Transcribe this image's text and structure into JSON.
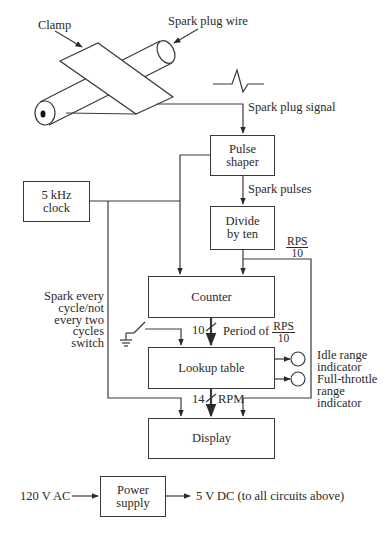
{
  "diagram": {
    "type": "block-diagram",
    "title_area": {
      "clamp_label": "Clamp",
      "wire_label": "Spark plug wire",
      "signal_label": "Spark plug signal"
    },
    "blocks": {
      "pulse_shaper": {
        "line1": "Pulse",
        "line2": "shaper"
      },
      "clock": {
        "line1": "5 kHz",
        "line2": "clock"
      },
      "divide": {
        "line1": "Divide",
        "line2": "by ten"
      },
      "counter": {
        "label": "Counter"
      },
      "lookup": {
        "label": "Lookup table"
      },
      "display": {
        "label": "Display"
      },
      "power": {
        "line1": "Power",
        "line2": "supply"
      }
    },
    "signals": {
      "spark_pulses": "Spark pulses",
      "rps_num": "RPS",
      "rps_den": "10",
      "bus_counter_width": "10",
      "period_of": "Period of",
      "period_num": "RPS",
      "period_den": "10",
      "bus_display_width": "14",
      "rpm": "RPM"
    },
    "switch_label": [
      "Spark every",
      "cycle/not",
      "every two",
      "cycles",
      "switch"
    ],
    "indicators": {
      "idle": [
        "Idle range",
        "indicator"
      ],
      "full": [
        "Full-throttle",
        "range",
        "indicator"
      ]
    },
    "power": {
      "input": "120 V AC",
      "output": "5 V DC (to all circuits above)"
    },
    "colors": {
      "line": "#3a3a3a",
      "text": "#2a2a2a",
      "background": "#ffffff"
    }
  }
}
